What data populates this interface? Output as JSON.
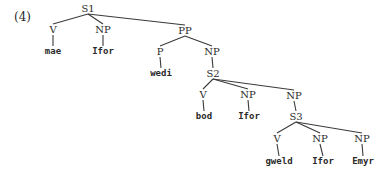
{
  "example_number": "(4)",
  "tree": {
    "nodes": {
      "S1": {
        "label": "S1",
        "x": 88,
        "y": 12
      },
      "V1": {
        "label": "V",
        "x": 53,
        "y": 33
      },
      "NP1": {
        "label": "NP",
        "x": 103,
        "y": 33
      },
      "mae": {
        "label": "mae",
        "x": 53,
        "y": 54
      },
      "Ifor1": {
        "label": "Ifor",
        "x": 103,
        "y": 54
      },
      "PP": {
        "label": "PP",
        "x": 185,
        "y": 34
      },
      "P": {
        "label": "P",
        "x": 160,
        "y": 55
      },
      "NP2": {
        "label": "NP",
        "x": 212,
        "y": 55
      },
      "wedi": {
        "label": "wedi",
        "x": 161,
        "y": 76
      },
      "S2": {
        "label": "S2",
        "x": 213,
        "y": 77
      },
      "V2": {
        "label": "V",
        "x": 203,
        "y": 98
      },
      "NP3": {
        "label": "NP",
        "x": 248,
        "y": 98
      },
      "NP4": {
        "label": "NP",
        "x": 294,
        "y": 99
      },
      "bod": {
        "label": "bod",
        "x": 204,
        "y": 119
      },
      "Ifor2": {
        "label": "Ifor",
        "x": 249,
        "y": 119
      },
      "S3": {
        "label": "S3",
        "x": 296,
        "y": 120
      },
      "V3": {
        "label": "V",
        "x": 277,
        "y": 142
      },
      "NP5": {
        "label": "NP",
        "x": 320,
        "y": 142
      },
      "NP6": {
        "label": "NP",
        "x": 362,
        "y": 142
      },
      "gweld": {
        "label": "gweld",
        "x": 279,
        "y": 164
      },
      "Ifor3": {
        "label": "Ifor",
        "x": 323,
        "y": 164
      },
      "Emyr": {
        "label": "Emyr",
        "x": 363,
        "y": 164
      }
    },
    "edges": [
      [
        "S1",
        "V1"
      ],
      [
        "S1",
        "NP1"
      ],
      [
        "S1",
        "PP"
      ],
      [
        "V1",
        "mae"
      ],
      [
        "NP1",
        "Ifor1"
      ],
      [
        "PP",
        "P"
      ],
      [
        "PP",
        "NP2"
      ],
      [
        "P",
        "wedi"
      ],
      [
        "NP2",
        "S2"
      ],
      [
        "S2",
        "V2"
      ],
      [
        "S2",
        "NP3"
      ],
      [
        "S2",
        "NP4"
      ],
      [
        "V2",
        "bod"
      ],
      [
        "NP3",
        "Ifor2"
      ],
      [
        "NP4",
        "S3"
      ],
      [
        "S3",
        "V3"
      ],
      [
        "S3",
        "NP5"
      ],
      [
        "S3",
        "NP6"
      ],
      [
        "V3",
        "gweld"
      ],
      [
        "NP5",
        "Ifor3"
      ],
      [
        "NP6",
        "Emyr"
      ]
    ],
    "terminals": [
      "mae",
      "Ifor1",
      "wedi",
      "bod",
      "Ifor2",
      "gweld",
      "Ifor3",
      "Emyr"
    ]
  }
}
